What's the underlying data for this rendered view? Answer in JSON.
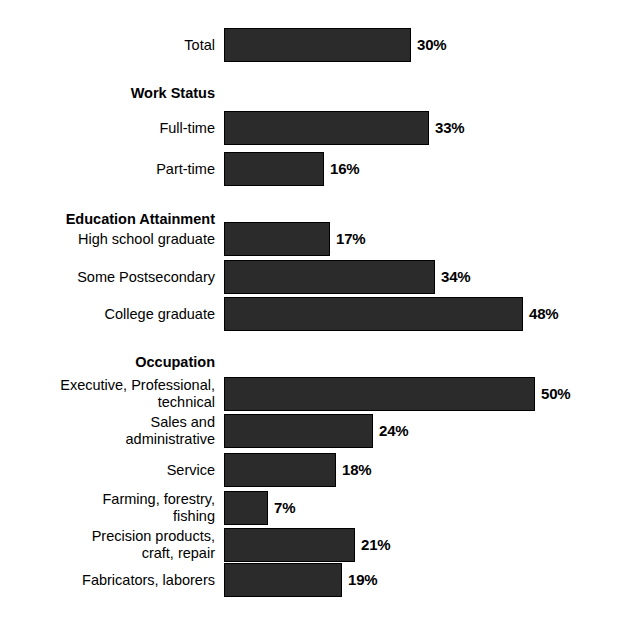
{
  "chart_data": {
    "type": "bar",
    "orientation": "horizontal",
    "title": "",
    "xlabel": "",
    "ylabel": "",
    "xlim": [
      0,
      60
    ],
    "grid": false,
    "legend": null,
    "value_suffix": "%",
    "groups": [
      {
        "header": "",
        "rows": [
          {
            "category": "Total",
            "value": 30,
            "label": "30%"
          }
        ]
      },
      {
        "header": "Work Status",
        "rows": [
          {
            "category": "Full-time",
            "value": 33,
            "label": "33%"
          },
          {
            "category": "Part-time",
            "value": 16,
            "label": "16%"
          }
        ]
      },
      {
        "header": "Education Attainment",
        "rows": [
          {
            "category": "High school graduate",
            "value": 17,
            "label": "17%"
          },
          {
            "category": "Some Postsecondary",
            "value": 34,
            "label": "34%"
          },
          {
            "category": "College graduate",
            "value": 48,
            "label": "48%"
          }
        ]
      },
      {
        "header": "Occupation",
        "rows": [
          {
            "category": "Executive, Professional,\ntechnical",
            "value": 50,
            "label": "50%"
          },
          {
            "category": "Sales and\nadministrative",
            "value": 24,
            "label": "24%"
          },
          {
            "category": "Service",
            "value": 18,
            "label": "18%"
          },
          {
            "category": "Farming, forestry,\nfishing",
            "value": 7,
            "label": "7%"
          },
          {
            "category": "Precision products,\ncraft, repair",
            "value": 21,
            "label": "21%"
          },
          {
            "category": "Fabricators, laborers",
            "value": 19,
            "label": "19%"
          }
        ]
      }
    ],
    "categories": [
      "Total",
      "Full-time",
      "Part-time",
      "High school graduate",
      "Some Postsecondary",
      "College graduate",
      "Executive, Professional, technical",
      "Sales and administrative",
      "Service",
      "Farming, forestry, fishing",
      "Precision products, craft, repair",
      "Fabricators, laborers"
    ],
    "values": [
      30,
      33,
      16,
      17,
      34,
      48,
      50,
      24,
      18,
      7,
      21,
      19
    ],
    "colors": {
      "bar_fill": "#2b2b2b",
      "bar_stroke": "#000000",
      "plot_background": "#ffffff",
      "stipple": "#9a9a9a",
      "text": "#000000"
    }
  },
  "layout": {
    "plot_left": 222,
    "plot_top": 14,
    "plot_width": 378,
    "plot_height": 594,
    "bar_origin_x": 224,
    "px_per_unit": 6.22,
    "label_right": 215
  }
}
